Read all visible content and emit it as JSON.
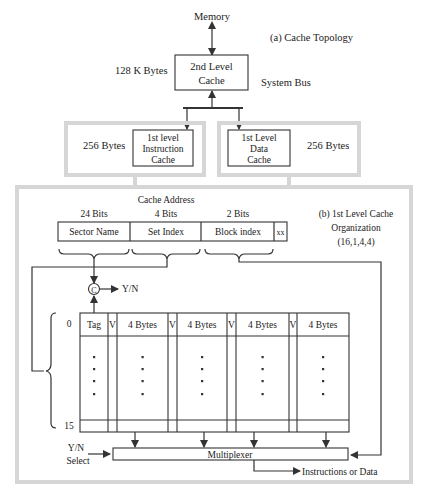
{
  "topology": {
    "title": "(a) Cache Topology",
    "memory_label": "Memory",
    "l2": {
      "line1": "2nd Level",
      "line2": "Cache",
      "size": "128 K Bytes"
    },
    "bus_label": "System Bus",
    "l1_instruction": {
      "line1": "1st level",
      "line2": "Instruction",
      "line3": "Cache",
      "size": "256 Bytes"
    },
    "l1_data": {
      "line1": "1st Level",
      "line2": "Data",
      "line3": "Cache",
      "size": "256 Bytes"
    }
  },
  "organization": {
    "title_line1": "(b) 1st Level Cache",
    "title_line2": "Organization",
    "title_line3": "(16,1,4,4)",
    "address_label": "Cache Address",
    "fields": [
      {
        "bits": "24 Bits",
        "name": "Sector Name"
      },
      {
        "bits": "4 Bits",
        "name": "Set Index"
      },
      {
        "bits": "2 Bits",
        "name": "Block index"
      },
      {
        "bits": "",
        "name": "xx"
      }
    ],
    "comparator": {
      "symbol": "C",
      "output": "Y/N"
    },
    "table": {
      "row_first": "0",
      "row_last": "15",
      "columns": [
        "Tag",
        "V",
        "4 Bytes",
        "V",
        "4 Bytes",
        "V",
        "4 Bytes",
        "V",
        "4 Bytes"
      ]
    },
    "mux": {
      "label": "Multiplexer",
      "select_line1": "Y/N",
      "select_line2": "Select",
      "output": "Instructions or Data"
    }
  }
}
